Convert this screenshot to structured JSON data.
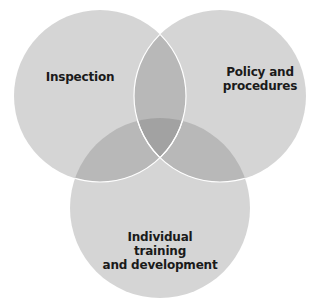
{
  "diagram": {
    "type": "venn",
    "circles": [
      {
        "id": "inspection",
        "label": "Inspection",
        "cx": 100,
        "cy": 96,
        "r": 86
      },
      {
        "id": "policy",
        "label": "Policy and procedures",
        "line1": "Policy and",
        "line2": "procedures",
        "cx": 220,
        "cy": 96,
        "r": 86
      },
      {
        "id": "training",
        "label": "Individual training and development",
        "line1": "Individual training",
        "line2": "and development",
        "cx": 160,
        "cy": 208,
        "r": 90
      }
    ],
    "colors": {
      "single": "#d5d5d5",
      "double": "#b8b8b8",
      "triple": "#a2a2a2",
      "stroke": "#ffffff",
      "text": "#1a1a1a"
    }
  }
}
